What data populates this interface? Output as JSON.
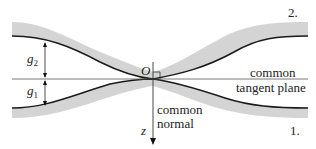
{
  "diagram": {
    "bodies": [
      {
        "id": "1",
        "label": "1."
      },
      {
        "id": "2",
        "label": "2."
      }
    ],
    "origin_label": "O",
    "axis_label": "z",
    "gap_labels": {
      "upper": {
        "symbol": "g",
        "subscript": "2"
      },
      "lower": {
        "symbol": "g",
        "subscript": "1"
      }
    },
    "annotations": {
      "tangent_plane_line1": "common",
      "tangent_plane_line2": "tangent plane",
      "normal_line1": "common",
      "normal_line2": "normal"
    },
    "colors": {
      "body_fill": "#d4d4d4",
      "surface_line": "#1a1a1a",
      "axis_line": "#555555",
      "text": "#222222"
    }
  }
}
